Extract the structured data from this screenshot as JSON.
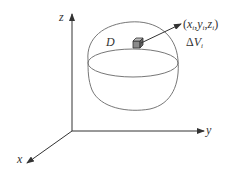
{
  "diagram": {
    "axes": {
      "z_label": "z",
      "y_label": "y",
      "x_label": "x"
    },
    "region_label": "D",
    "point_label": {
      "open": "(",
      "x": "x",
      "xi": "i",
      "y": "y",
      "yi": "i",
      "z": "z",
      "zi": "i",
      "close": ")",
      "sep": ","
    },
    "volume_label": {
      "delta": "Δ",
      "v": "V",
      "sub": "i"
    },
    "colors": {
      "axis": "#333333",
      "region_outline": "#777777",
      "cube_fill": "#888888"
    }
  }
}
